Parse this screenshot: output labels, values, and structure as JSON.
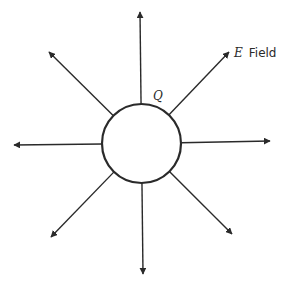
{
  "diagram": {
    "charge": {
      "label": "Q",
      "center": [
        141.5,
        143.5
      ],
      "radius": 39.5
    },
    "field_label": {
      "symbol": "E",
      "text": "Field"
    },
    "colors": {
      "stroke": "#2a2a2a",
      "background": "#ffffff"
    },
    "field_lines": [
      {
        "direction": "up",
        "tip": [
          140,
          12
        ]
      },
      {
        "direction": "up-right",
        "tip": [
          229,
          52
        ]
      },
      {
        "direction": "right",
        "tip": [
          270,
          141
        ]
      },
      {
        "direction": "down-right",
        "tip": [
          232,
          234
        ]
      },
      {
        "direction": "down",
        "tip": [
          143,
          274
        ]
      },
      {
        "direction": "down-left",
        "tip": [
          51,
          237
        ]
      },
      {
        "direction": "left",
        "tip": [
          14,
          145
        ]
      },
      {
        "direction": "up-left",
        "tip": [
          49,
          52
        ]
      }
    ]
  }
}
